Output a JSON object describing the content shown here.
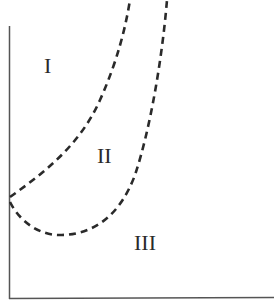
{
  "diagram": {
    "type": "phase-region-diagram",
    "axes": {
      "color": "#555555",
      "x_axis_label": "",
      "y_axis_label": ""
    },
    "curves": [
      {
        "name": "outer-boundary",
        "style": "dashed",
        "color": "#2a2a2a",
        "description": "Curve from left axis rising to top, separating region I and II"
      },
      {
        "name": "inner-boundary",
        "style": "dashed",
        "color": "#2a2a2a",
        "description": "U-shaped curve from left axis dipping down then rising to top, separating region II and III"
      }
    ],
    "regions": [
      {
        "id": "I",
        "label": "I"
      },
      {
        "id": "II",
        "label": "II"
      },
      {
        "id": "III",
        "label": "III"
      }
    ]
  }
}
